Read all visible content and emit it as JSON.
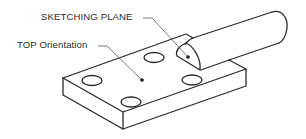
{
  "diagram": {
    "type": "isometric-part-drawing",
    "callouts": [
      {
        "id": "sketching-plane",
        "label": "SKETCHING PLANE",
        "target": "half-disk face on cylinder boss"
      },
      {
        "id": "top-orientation",
        "label": "TOP Orientation",
        "target": "top face of rectangular base plate"
      }
    ],
    "features": {
      "base_plate_holes": 4,
      "cylinder_boss": 1
    },
    "colors": {
      "line": "#2a2a2a",
      "leader": "#555555",
      "background": "#ffffff"
    }
  }
}
